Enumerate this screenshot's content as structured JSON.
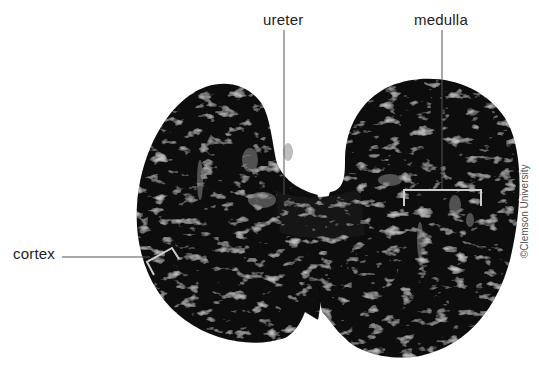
{
  "figure": {
    "labels": {
      "ureter": "ureter",
      "medulla": "medulla",
      "cortex": "cortex"
    },
    "credit": "©Clemson University"
  },
  "colors": {
    "background": "#ffffff",
    "tissue_dark": "#0a0a0a",
    "tissue_highlight": "#9a9a9a",
    "leader_line": "#555555",
    "label_text": "#222222"
  }
}
